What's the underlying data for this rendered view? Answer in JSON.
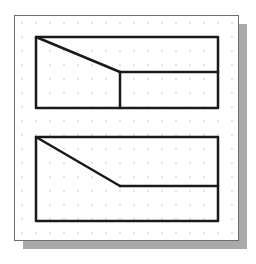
{
  "canvas": {
    "width": 256,
    "height": 264,
    "background": "#ffffff"
  },
  "frame": {
    "x": 14,
    "y": 15,
    "width": 224,
    "height": 225,
    "border_color": "#6e6e6e",
    "shadow_color": "#a9a9a9",
    "shadow_offset": 8
  },
  "grid": {
    "type": "dot-grid",
    "origin_x": 22,
    "origin_y": 23,
    "spacing": 14,
    "dot_color": "#b5b5b5"
  },
  "line_color": "#1a1a1a",
  "line_width": 2.5,
  "shapes": [
    {
      "name": "top-view-profile",
      "outline": [
        [
          36,
          37
        ],
        [
          218,
          37
        ],
        [
          218,
          108
        ],
        [
          36,
          108
        ]
      ],
      "segments": [
        [
          [
            36,
            37
          ],
          [
            120,
            72
          ]
        ],
        [
          [
            120,
            72
          ],
          [
            218,
            72
          ]
        ],
        [
          [
            120,
            72
          ],
          [
            120,
            108
          ]
        ]
      ]
    },
    {
      "name": "bottom-view-profile",
      "outline": [
        [
          36,
          137
        ],
        [
          218,
          137
        ],
        [
          218,
          221
        ],
        [
          36,
          221
        ]
      ],
      "segments": [
        [
          [
            36,
            137
          ],
          [
            120,
            186
          ]
        ],
        [
          [
            120,
            186
          ],
          [
            218,
            186
          ]
        ]
      ]
    }
  ]
}
